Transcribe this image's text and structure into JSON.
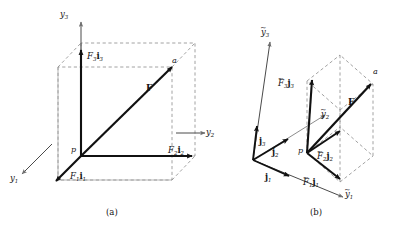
{
  "figure": {
    "panels": [
      {
        "id": "a",
        "caption": "(a)",
        "origin_point": "p",
        "tip_point": "a",
        "axes": [
          {
            "name": "y-axis-1",
            "label_main": "y",
            "label_sub": "1"
          },
          {
            "name": "y-axis-2",
            "label_main": "y",
            "label_sub": "2"
          },
          {
            "name": "y-axis-3",
            "label_main": "y",
            "label_sub": "3"
          }
        ],
        "components": [
          {
            "name": "component-1",
            "scalar": "F",
            "scalar_sub": "1",
            "basis": "i",
            "basis_sub": "1"
          },
          {
            "name": "component-2",
            "scalar": "F",
            "scalar_sub": "2",
            "basis": "i",
            "basis_sub": "2"
          },
          {
            "name": "component-3",
            "scalar": "F",
            "scalar_sub": "3",
            "basis": "i",
            "basis_sub": "3"
          }
        ],
        "resultant": "F"
      },
      {
        "id": "b",
        "caption": "(b)",
        "origin_point": "p",
        "tip_point": "a",
        "axes": [
          {
            "name": "y-tilde-axis-1",
            "label_main": "y",
            "label_sub": "1",
            "tilde": true
          },
          {
            "name": "y-tilde-axis-2",
            "label_main": "y",
            "label_sub": "2",
            "tilde": true
          },
          {
            "name": "y-tilde-axis-3",
            "label_main": "y",
            "label_sub": "3",
            "tilde": true
          }
        ],
        "basis_vectors": [
          {
            "name": "basis-j1",
            "label": "j",
            "sub": "1"
          },
          {
            "name": "basis-j2",
            "label": "j",
            "sub": "2"
          },
          {
            "name": "basis-j3",
            "label": "j",
            "sub": "3"
          }
        ],
        "components": [
          {
            "name": "component-tilde-1",
            "scalar": "F",
            "scalar_sub": "1",
            "basis": "j",
            "basis_sub": "1",
            "tilde": true
          },
          {
            "name": "component-tilde-2",
            "scalar": "F",
            "scalar_sub": "2",
            "basis": "j",
            "basis_sub": "2",
            "tilde": true
          },
          {
            "name": "component-tilde-3",
            "scalar": "F",
            "scalar_sub": "3",
            "basis": "j",
            "basis_sub": "3",
            "tilde": true
          }
        ],
        "resultant": "F"
      }
    ],
    "colors": {
      "solid_line": "#111111",
      "dashed_line": "#8a8a8a",
      "thin_line": "#6f6f6f",
      "background": "#ffffff"
    }
  },
  "labels": {
    "a_y1": "y",
    "a_y1_sub": "1",
    "a_y2": "y",
    "a_y2_sub": "2",
    "a_y3": "y",
    "a_y3_sub": "3",
    "a_p": "p",
    "a_a": "a",
    "a_F": "F",
    "a_F1i1_F": "F",
    "a_F1i1_Fsub": "1",
    "a_F1i1_i": "i",
    "a_F1i1_isub": "1",
    "a_F2i2_F": "F",
    "a_F2i2_Fsub": "2",
    "a_F2i2_i": "i",
    "a_F2i2_isub": "2",
    "a_F3i3_F": "F",
    "a_F3i3_Fsub": "3",
    "a_F3i3_i": "i",
    "a_F3i3_isub": "3",
    "caption_a": "(a)",
    "b_y1": "y",
    "b_y1_sub": "1",
    "b_y2": "y",
    "b_y2_sub": "2",
    "b_y3": "y",
    "b_y3_sub": "3",
    "b_j1": "j",
    "b_j1_sub": "1",
    "b_j2": "j",
    "b_j2_sub": "2",
    "b_j3": "j",
    "b_j3_sub": "3",
    "b_p": "p",
    "b_a": "a",
    "b_F": "F",
    "b_F1j1_F": "F",
    "b_F1j1_Fsub": "1",
    "b_F1j1_j": "j",
    "b_F1j1_jsub": "1",
    "b_F2j2_F": "F",
    "b_F2j2_Fsub": "2",
    "b_F2j2_j": "j",
    "b_F2j2_jsub": "2",
    "b_F3j3_F": "F",
    "b_F3j3_Fsub": "3",
    "b_F3j3_j": "j",
    "b_F3j3_jsub": "3",
    "caption_b": "(b)",
    "tilde_glyph": "~"
  }
}
